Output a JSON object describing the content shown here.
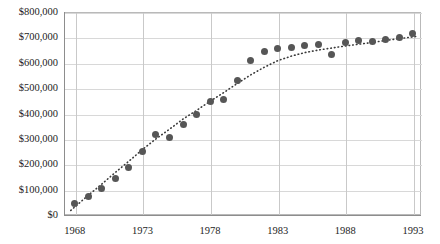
{
  "chart_data": {
    "type": "scatter",
    "title": "",
    "subtitle": "",
    "xlabel": "",
    "ylabel": "",
    "xlim": [
      1967.2,
      1993.6
    ],
    "ylim": [
      0,
      800000
    ],
    "grid": true,
    "legend": false,
    "legend_position": "none",
    "y_tick_labels": [
      "$0",
      "$100,000",
      "$200,000",
      "$300,000",
      "$400,000",
      "$500,000",
      "$600,000",
      "$700,000",
      "$800,000"
    ],
    "y_tick_values": [
      0,
      100000,
      200000,
      300000,
      400000,
      500000,
      600000,
      700000,
      800000
    ],
    "x_tick_labels": [
      "1968",
      "1973",
      "1978",
      "1983",
      "1988",
      "1993"
    ],
    "x_tick_values": [
      1968,
      1973,
      1978,
      1983,
      1988,
      1993
    ],
    "marker_color": "#565656",
    "trendline_color": "#3a3a3a",
    "trendline_style": "dotted",
    "gridline_color": "#d8d8d8",
    "axis_color": "#8d8d8d",
    "series": [
      {
        "name": "Value",
        "x": [
          1968,
          1969,
          1970,
          1971,
          1972,
          1973,
          1974,
          1975,
          1976,
          1977,
          1978,
          1979,
          1980,
          1981,
          1982,
          1983,
          1984,
          1985,
          1986,
          1987,
          1988,
          1989,
          1990,
          1991,
          1992,
          1993
        ],
        "values": [
          47000,
          73000,
          103000,
          143000,
          188000,
          250000,
          318000,
          305000,
          355000,
          398000,
          448000,
          455000,
          530000,
          608000,
          645000,
          655000,
          662000,
          668000,
          672000,
          632000,
          678000,
          688000,
          683000,
          692000,
          698000,
          715000
        ]
      }
    ],
    "trendline": {
      "x": [
        1967.7,
        1969,
        1970,
        1971,
        1972,
        1973,
        1974,
        1975,
        1976,
        1977,
        1978,
        1979,
        1980,
        1981,
        1982,
        1983,
        1984,
        1985,
        1986,
        1987,
        1988,
        1989,
        1990,
        1991,
        1992,
        1993.3
      ],
      "values": [
        18000,
        78000,
        122000,
        168000,
        212000,
        258000,
        300000,
        338000,
        378000,
        412000,
        448000,
        482000,
        518000,
        552000,
        582000,
        608000,
        626000,
        640000,
        650000,
        658000,
        666000,
        673000,
        680000,
        688000,
        695000,
        704000
      ]
    }
  }
}
